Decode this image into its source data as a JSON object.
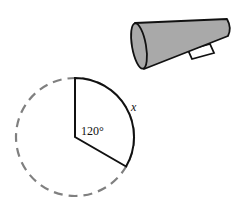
{
  "diagram": {
    "sector": {
      "angle_label": "120°",
      "arc_label": "x",
      "angle_degrees": 120,
      "line_color": "#111111",
      "dashed_circle_color": "#808080"
    },
    "megaphone": {
      "fill_color": "#a9a9a9",
      "outline_color": "#111111"
    }
  }
}
